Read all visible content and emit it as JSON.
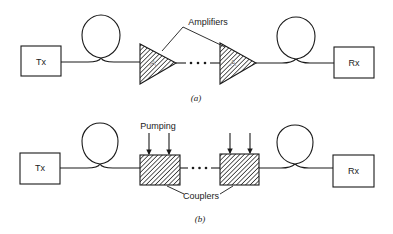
{
  "diagram_a": {
    "caption": "(a)",
    "transmitter_label": "Tx",
    "receiver_label": "Rx",
    "amplifier_label": "A",
    "callout_label": "Amplifiers",
    "ellipsis": "• • •"
  },
  "diagram_b": {
    "caption": "(b)",
    "transmitter_label": "Tx",
    "receiver_label": "Rx",
    "pumping_label": "Pumping",
    "callout_label": "Couplers",
    "ellipsis": "• • •"
  },
  "colors": {
    "stroke": "#1a1a1a",
    "background": "#ffffff"
  }
}
